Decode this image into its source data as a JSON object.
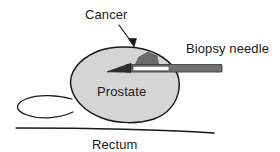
{
  "figure": {
    "background_color": "#ffffff",
    "width": 280,
    "height": 152
  },
  "labels": {
    "cancer": "Cancer",
    "biopsy_needle": "Biopsy needle",
    "prostate": "Prostate",
    "rectum": "Rectum"
  },
  "colors": {
    "outline": "#1a1a1a",
    "prostate_fill": "#d5d5d5",
    "cancer_fill": "#6b6b6b",
    "needle_shaft": "#707070",
    "needle_tip": "#333333",
    "needle_window": "#ffffff",
    "text": "#1a1a1a"
  },
  "shapes": {
    "prostate": {
      "name": "prostate-gland",
      "fill": "#d5d5d5",
      "stroke": "#1a1a1a",
      "path": "M 96 52 C 112 45, 140 45, 157 54 C 172 62, 181 74, 179 89 C 177 103, 168 114, 154 119 C 139 124, 118 124, 102 118 C 86 112, 74 101, 71 87 C 68 72, 80 59, 96 52 Z"
    },
    "seminal_vesicle": {
      "name": "seminal-vesicle-ellipse",
      "fill": "none",
      "stroke": "#1a1a1a",
      "path": "M 72 99 C 58 96, 38 95, 26 99 C 15 103, 14 110, 25 114 C 38 119, 58 118, 72 113"
    },
    "cancer_lesion": {
      "name": "cancer-lesion",
      "fill": "#6b6b6b",
      "stroke": "#4a4a4a",
      "path": "M 135 66 L 140 56 L 149 53 L 156 57 L 158 66 Z"
    },
    "rectum_wall": {
      "name": "rectum-wall-line",
      "stroke": "#1a1a1a",
      "path": "M 16 128 C 70 128, 150 129, 214 133"
    },
    "cancer_arrow": {
      "name": "cancer-pointer-arrow",
      "stroke": "#1a1a1a",
      "path": "M 119 25 L 133 45",
      "head": "M 133 47 L 129 39 L 136 39 Z"
    },
    "needle": {
      "name": "biopsy-needle",
      "shaft": {
        "x": 124,
        "y": 65,
        "w": 98,
        "h": 7
      },
      "tip": "M 108 71 L 129 64 L 129 72 Z",
      "window": {
        "x": 133,
        "y": 66,
        "w": 36,
        "h": 5
      }
    }
  }
}
